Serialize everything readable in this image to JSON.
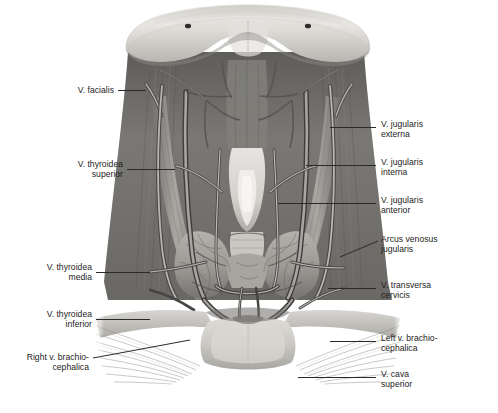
{
  "figure": {
    "type": "anatomical-illustration",
    "region": "anterior cervical region, superficial and deep venous anatomy",
    "style": "grayscale medical illustration",
    "colors": {
      "background": "#ffffff",
      "bone_light": "#d9d7d2",
      "muscle_mid": "#8e8c88",
      "muscle_dark": "#5d5b58",
      "vein_light": "#b9b7b3",
      "vein_dark": "#4a4846",
      "thyroid": "#a5a29d",
      "fascia": "#c5c3bf",
      "leader_line": "#2a2a2a",
      "label_text": "#1c1c1c"
    },
    "structures": [
      "mandible",
      "mental foramen (left)",
      "mental foramen (right)",
      "platysma / cervical fascia",
      "sternocleidomastoid muscle (left)",
      "sternocleidomastoid muscle (right)",
      "thyroid cartilage",
      "thyroid gland isthmus",
      "thyroid gland lobe (left)",
      "thyroid gland lobe (right)",
      "trachea",
      "clavicle (left)",
      "clavicle (right)",
      "sternum / manubrium",
      "pectoralis major"
    ]
  },
  "labels_left": [
    {
      "id": "v-facialis",
      "text": "V. facialis",
      "lines": [
        "V. facialis"
      ]
    },
    {
      "id": "v-thyroidea-superior",
      "text": "V. thyroidea superior",
      "lines": [
        "V. thyroidea",
        "superior"
      ]
    },
    {
      "id": "v-thyroidea-media",
      "text": "V. thyroidea media",
      "lines": [
        "V. thyroidea",
        "media"
      ]
    },
    {
      "id": "v-thyroidea-inferior",
      "text": "V. thyroidea inferior",
      "lines": [
        "V. thyroidea",
        "inferior"
      ]
    },
    {
      "id": "right-v-brachiocephalica",
      "text": "Right v. brachio-cephalica",
      "lines": [
        "Right v. brachio-",
        "cephalica"
      ]
    }
  ],
  "labels_right": [
    {
      "id": "v-jugularis-externa",
      "text": "V. jugularis externa",
      "lines": [
        "V. jugularis",
        "externa"
      ]
    },
    {
      "id": "v-jugularis-interna",
      "text": "V. jugularis interna",
      "lines": [
        "V. jugularis",
        "interna"
      ]
    },
    {
      "id": "v-jugularis-anterior",
      "text": "V. jugularis anterior",
      "lines": [
        "V. jugularis",
        "anterior"
      ]
    },
    {
      "id": "arcus-venosus-jugularis",
      "text": "Arcus venosus jugularis",
      "lines": [
        "Arcus venosus",
        "jugularis"
      ]
    },
    {
      "id": "v-transversa-cervicis",
      "text": "V. transversa cervicis",
      "lines": [
        "V. transversa",
        "cervicis"
      ]
    },
    {
      "id": "left-v-brachiocephalica",
      "text": "Left v. brachio-cephalica",
      "lines": [
        "Left v. brachio-",
        "cephalica"
      ]
    },
    {
      "id": "v-cava-superior",
      "text": "V. cava superior",
      "lines": [
        "V. cava",
        "superior"
      ]
    }
  ]
}
